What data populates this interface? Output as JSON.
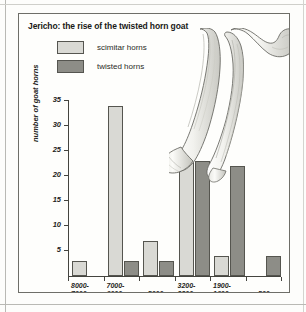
{
  "figure": {
    "title": "Jericho: the rise of the twisted horn goat",
    "illustration_name": "goat-horn-specimens"
  },
  "legend": {
    "position": "top-left",
    "items": [
      {
        "label": "scimitar horns",
        "color": "#d9d9d4"
      },
      {
        "label": "twisted horns",
        "color": "#8d8d87"
      }
    ]
  },
  "chart_data": {
    "type": "bar",
    "title": "Jericho: the rise of the twisted horn goat",
    "xlabel": "",
    "ylabel": "number of goat horns",
    "ylim": [
      0,
      35
    ],
    "yticks": [
      5,
      10,
      15,
      20,
      25,
      30,
      35
    ],
    "grid": false,
    "legend_position": "top-left",
    "categories": [
      "8000-7000 BC",
      "7000-6000 BC",
      "c.5000 BC",
      "3200-2300 BC",
      "1900-1600 BC",
      "AD 500"
    ],
    "category_lines": [
      {
        "line1": "8000-",
        "line2": "7000",
        "era": "BC"
      },
      {
        "line1": "7000-",
        "line2": "6000",
        "era": "BC"
      },
      {
        "line1": "c.5000",
        "line2": "",
        "era": "BC"
      },
      {
        "line1": "3200-",
        "line2": "2300",
        "era": "BC"
      },
      {
        "line1": "1900-",
        "line2": "1600",
        "era": "BC"
      },
      {
        "line1": "AD 500",
        "line2": "",
        "era": ""
      }
    ],
    "series": [
      {
        "name": "scimitar horns",
        "color": "#d9d9d4",
        "values": [
          3,
          34,
          7,
          23,
          4,
          0
        ]
      },
      {
        "name": "twisted horns",
        "color": "#8d8d87",
        "values": [
          0,
          3,
          3,
          23,
          22,
          4
        ]
      }
    ]
  }
}
